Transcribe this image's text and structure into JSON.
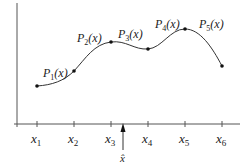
{
  "diagram": {
    "axis_color": "#555555",
    "curve_color": "#333333",
    "x_ticks": [
      {
        "base": "x",
        "sub": "1",
        "px": 37
      },
      {
        "base": "x",
        "sub": "2",
        "px": 74
      },
      {
        "base": "x",
        "sub": "3",
        "px": 111
      },
      {
        "base": "x",
        "sub": "4",
        "px": 148
      },
      {
        "base": "x",
        "sub": "5",
        "px": 185
      },
      {
        "base": "x",
        "sub": "6",
        "px": 222
      }
    ],
    "nodes": [
      {
        "x": 37,
        "y": 86
      },
      {
        "x": 74,
        "y": 71
      },
      {
        "x": 111,
        "y": 42
      },
      {
        "x": 148,
        "y": 49
      },
      {
        "x": 185,
        "y": 29
      },
      {
        "x": 222,
        "y": 66
      }
    ],
    "segment_labels": [
      {
        "base": "P",
        "sub": "1",
        "arg": "(x)"
      },
      {
        "base": "P",
        "sub": "2",
        "arg": "(x)"
      },
      {
        "base": "P",
        "sub": "3",
        "arg": "(x)"
      },
      {
        "base": "P",
        "sub": "4",
        "arg": "(x)"
      },
      {
        "base": "P",
        "sub": "5",
        "arg": "(x)"
      }
    ],
    "marker": {
      "label": "x̂",
      "px": 123
    }
  }
}
